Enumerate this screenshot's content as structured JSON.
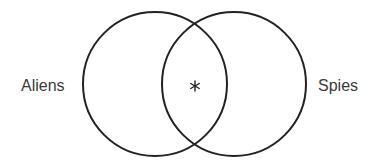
{
  "diagram": {
    "type": "venn",
    "sets": [
      {
        "id": "aliens",
        "label": "Aliens"
      },
      {
        "id": "spies",
        "label": "Spies"
      }
    ],
    "intersection_marker": "asterisk",
    "intersection_marker_glyph": "*",
    "colors": {
      "stroke": "#222222",
      "label": "#3a3a3a",
      "background": "#ffffff"
    }
  }
}
